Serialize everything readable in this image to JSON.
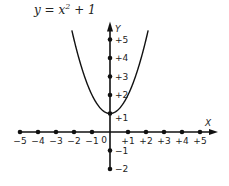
{
  "chart_data": {
    "type": "line",
    "title_parts": {
      "lhs": "y = x",
      "exp": "2",
      "rhs": " + 1"
    },
    "xlabel": "X",
    "ylabel": "Y",
    "xlim": [
      -5,
      5
    ],
    "ylim": [
      -2,
      5
    ],
    "grid": false,
    "legend": "none",
    "function": "x^2 + 1",
    "x_ticks": [
      -5,
      -4,
      -3,
      -2,
      -1,
      1,
      2,
      3,
      4,
      5
    ],
    "x_tick_labels": [
      "−5",
      "−4",
      "−3",
      "−2",
      "−1",
      "+1",
      "+2",
      "+3",
      "+4",
      "+5"
    ],
    "y_ticks": [
      -2,
      -1,
      1,
      2,
      3,
      4,
      5
    ],
    "y_tick_labels": [
      "−2",
      "−1",
      "+1",
      "+2",
      "+3",
      "+4",
      "+5"
    ],
    "origin_label": "0",
    "series": [
      {
        "name": "y = x² + 1",
        "x": [
          -2.1,
          -2,
          -1.5,
          -1,
          -0.5,
          0,
          0.5,
          1,
          1.5,
          2,
          2.1
        ],
        "y": [
          5.41,
          5,
          3.25,
          2,
          1.25,
          1,
          1.25,
          2,
          3.25,
          5,
          5.41
        ]
      }
    ],
    "vertex": [
      0,
      1
    ]
  }
}
